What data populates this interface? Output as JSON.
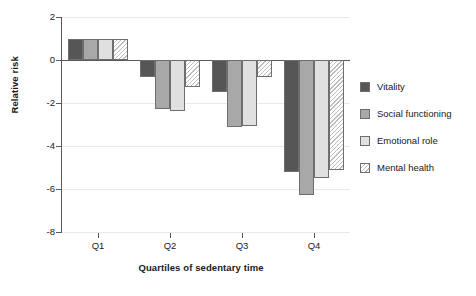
{
  "chart_data": {
    "type": "bar",
    "title": "",
    "xlabel": "Quartiles of sedentary time",
    "ylabel": "Relative risk",
    "categories": [
      "Q1",
      "Q2",
      "Q3",
      "Q4"
    ],
    "ylim": [
      -8,
      2
    ],
    "yticks": [
      2,
      0,
      -2,
      -4,
      -6,
      -8
    ],
    "ytick_labels": [
      "2",
      "0",
      "-2",
      "-4",
      "-6",
      "-8"
    ],
    "grid": true,
    "legend_position": "right",
    "series": [
      {
        "name": "Vitality",
        "color": "#565656",
        "pattern": "solid",
        "values": [
          1.0,
          -0.8,
          -1.5,
          -5.2
        ]
      },
      {
        "name": "Social functioning",
        "color": "#a8a8a8",
        "pattern": "solid",
        "values": [
          1.0,
          -2.3,
          -3.1,
          -6.3
        ]
      },
      {
        "name": "Emotional role",
        "color": "#e0e0e0",
        "pattern": "solid",
        "values": [
          1.0,
          -2.35,
          -3.05,
          -5.5
        ]
      },
      {
        "name": "Mental health",
        "color": "#ffffff",
        "pattern": "diagonal-hatch",
        "values": [
          1.0,
          -1.25,
          -0.8,
          -5.1
        ]
      }
    ]
  },
  "axis": {
    "ytick_labels": [
      "2",
      "0",
      "-2",
      "-4",
      "-6",
      "-8"
    ],
    "xtick_labels": [
      "Q1",
      "Q2",
      "Q3",
      "Q4"
    ],
    "ylabel": "Relative risk",
    "xlabel": "Quartiles of sedentary time"
  },
  "legend": {
    "items": [
      {
        "label": "Vitality"
      },
      {
        "label": "Social functioning"
      },
      {
        "label": "Emotional role"
      },
      {
        "label": "Mental health"
      }
    ]
  }
}
